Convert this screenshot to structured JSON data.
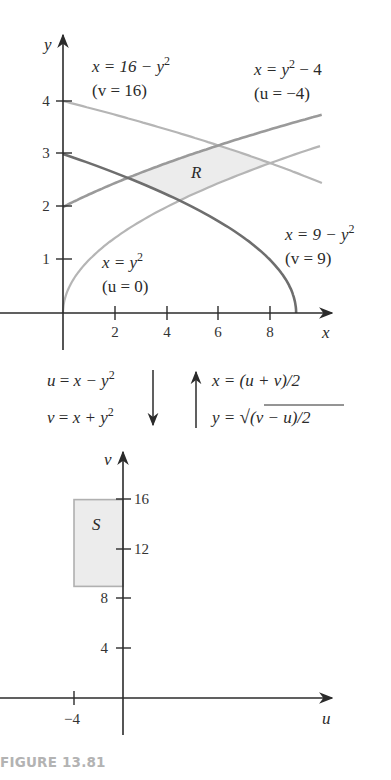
{
  "caption": "FIGURE 13.81",
  "colors": {
    "axis": "#2b2b2b",
    "curve_light": "#b5b5b5",
    "curve_medium": "#9a9a9a",
    "curve_dark": "#6e6e6e",
    "region_fill": "#ececec",
    "region_stroke": "#b0b0b0",
    "caption": "#b3b3b3"
  },
  "chart_data": [
    {
      "type": "line",
      "title": "Region R in the xy-plane",
      "xlabel": "x",
      "ylabel": "y",
      "xlim": [
        0,
        10
      ],
      "ylim": [
        0,
        4.4
      ],
      "x_ticks": [
        2,
        4,
        6,
        8
      ],
      "y_ticks": [
        1,
        2,
        3,
        4
      ],
      "grid": false,
      "region_label": "R",
      "series": [
        {
          "name": "x = 16 − y²",
          "annotation": "(v = 16)",
          "equation": "x = 16 - y^2",
          "y_range": [
            2.45,
            4
          ],
          "shade": "light"
        },
        {
          "name": "x = y² − 4",
          "annotation": "(u = −4)",
          "equation": "x = y^2 - 4",
          "y_range": [
            2,
            3.74
          ],
          "shade": "medium"
        },
        {
          "name": "x = 9 − y²",
          "annotation": "(v = 9)",
          "equation": "x = 9 - y^2",
          "y_range": [
            0,
            3
          ],
          "shade": "dark"
        },
        {
          "name": "x = y²",
          "annotation": "(u = 0)",
          "equation": "x = y^2",
          "y_range": [
            0,
            3.15
          ],
          "shade": "light"
        }
      ],
      "region_vertices_note": "R bounded by u=-4, u=0, v=9, v=16"
    },
    {
      "type": "area",
      "title": "Region S in the uv-plane",
      "xlabel": "u",
      "ylabel": "v",
      "xlim": [
        -10,
        17
      ],
      "ylim": [
        -5,
        20
      ],
      "x_ticks": [
        -4
      ],
      "y_ticks": [
        4,
        8,
        12,
        16
      ],
      "grid": false,
      "region_label": "S",
      "rectangle": {
        "u_min": -4,
        "u_max": 0,
        "v_min": 9,
        "v_max": 16
      }
    }
  ],
  "transform": {
    "forward": [
      {
        "lhs": "u",
        "rhs_a": "x − y",
        "sup": "2"
      },
      {
        "lhs": "v",
        "rhs_a": "x + y",
        "sup": "2"
      }
    ],
    "inverse": [
      {
        "text": "x = (u + v)/2"
      },
      {
        "lhs": "y = ",
        "radicand": "(v − u)/2"
      }
    ]
  },
  "labels": {
    "top_left_eq": "x = 16 − y",
    "top_left_sub": "(v = 16)",
    "top_right_eq": "x = y",
    "top_right_eq_tail": " − 4",
    "top_right_sub": "(u = −4)",
    "bottom_right_eq": "x = 9 − y",
    "bottom_right_sub": "(v = 9)",
    "bottom_left_eq": "x = y",
    "bottom_left_sub": "(u = 0)",
    "sup2": "2",
    "axis_x": "x",
    "axis_y": "y",
    "axis_u": "u",
    "axis_v": "v",
    "region_R": "R",
    "region_S": "S",
    "xy_ticks_x": [
      "2",
      "4",
      "6",
      "8"
    ],
    "xy_ticks_y": [
      "1",
      "2",
      "3",
      "4"
    ],
    "uv_ticks_v": [
      "4",
      "8",
      "12",
      "16"
    ],
    "uv_ticks_u": [
      "−4"
    ]
  }
}
